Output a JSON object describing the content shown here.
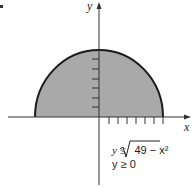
{
  "diagram": {
    "marker": "▪",
    "axes": {
      "x_label": "x",
      "y_label": "y"
    },
    "inequalities": [
      "y ≤ √49 − x²",
      "y ≥ 0"
    ],
    "inequality_1_lhs": "y ≤ ",
    "inequality_1_radicand": "49 − x²",
    "inequality_2": "y ≥ 0",
    "region": "upper half-disk of radius 7",
    "ticks": {
      "y_count": 6,
      "x_count": 7
    },
    "colors": {
      "fill": "#a9a9a9",
      "stroke": "#1a1a1a",
      "axis": "#333333"
    }
  }
}
